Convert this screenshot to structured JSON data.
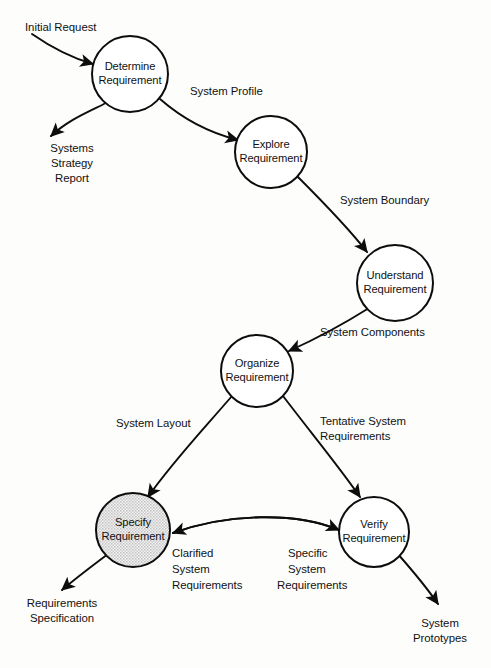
{
  "diagram": {
    "type": "data-flow-diagram",
    "width": 491,
    "height": 668,
    "background_color": "#fdfdfc",
    "line_color": "#0d0d0d",
    "text_color": "#111111",
    "shaded_fill_color": "#dcdcdc"
  },
  "processes": [
    {
      "id": "determine",
      "line1": "Determine",
      "line2": "Requirement",
      "cx": 130,
      "cy": 74,
      "r": 38,
      "shaded": false
    },
    {
      "id": "explore",
      "line1": "Explore",
      "line2": "Requirement",
      "cx": 271,
      "cy": 152,
      "r": 36,
      "shaded": false
    },
    {
      "id": "understand",
      "line1": "Understand",
      "line2": "Requirement",
      "cx": 395,
      "cy": 283,
      "r": 38,
      "shaded": false
    },
    {
      "id": "organize",
      "line1": "Organize",
      "line2": "Requirement",
      "cx": 257,
      "cy": 371,
      "r": 36,
      "shaded": false
    },
    {
      "id": "specify",
      "line1": "Specify",
      "line2": "Requirement",
      "cx": 133,
      "cy": 530,
      "r": 37,
      "shaded": true
    },
    {
      "id": "verify",
      "line1": "Verify",
      "line2": "Requirement",
      "cx": 374,
      "cy": 532,
      "r": 35,
      "shaded": false
    }
  ],
  "flows": [
    {
      "id": "initial-request",
      "label_lines": [
        "Initial Request"
      ],
      "from": "external-input",
      "to": "determine"
    },
    {
      "id": "systems-strategy-report",
      "label_lines": [
        "Systems",
        "Strategy",
        "Report"
      ],
      "from": "determine",
      "to": "external-output"
    },
    {
      "id": "system-profile",
      "label_lines": [
        "System Profile"
      ],
      "from": "determine",
      "to": "explore"
    },
    {
      "id": "system-boundary",
      "label_lines": [
        "System Boundary"
      ],
      "from": "explore",
      "to": "understand"
    },
    {
      "id": "system-components",
      "label_lines": [
        "System Components"
      ],
      "from": "understand",
      "to": "organize"
    },
    {
      "id": "system-layout",
      "label_lines": [
        "System Layout"
      ],
      "from": "organize",
      "to": "specify"
    },
    {
      "id": "tentative-system-requirements",
      "label_lines": [
        "Tentative System",
        "Requirements"
      ],
      "from": "organize",
      "to": "verify"
    },
    {
      "id": "clarified-system-requirements",
      "label_lines": [
        "Clarified",
        "System",
        "Requirements"
      ],
      "from": "verify",
      "to": "specify"
    },
    {
      "id": "specific-system-requirements",
      "label_lines": [
        "Specific",
        "System",
        "Requirements"
      ],
      "from": "specify",
      "to": "verify"
    },
    {
      "id": "requirements-specification",
      "label_lines": [
        "Requirements",
        "Specification"
      ],
      "from": "specify",
      "to": "external-output"
    },
    {
      "id": "system-prototypes",
      "label_lines": [
        "System",
        "Prototypes"
      ],
      "from": "verify",
      "to": "external-output"
    }
  ],
  "labels": {
    "initial_request": "Initial Request",
    "systems": "Systems",
    "strategy": "Strategy",
    "report": "Report",
    "system_profile": "System Profile",
    "system_boundary": "System Boundary",
    "system_components": "System Components",
    "system_layout": "System Layout",
    "tentative_system": "Tentative System",
    "requirements_1": "Requirements",
    "clarified": "Clarified",
    "system_1": "System",
    "requirements_2": "Requirements",
    "specific": "Specific",
    "system_2": "System",
    "requirements_3": "Requirements",
    "requirements_spec_1": "Requirements",
    "requirements_spec_2": "Specification",
    "system_3": "System",
    "prototypes": "Prototypes",
    "p_determine_1": "Determine",
    "p_determine_2": "Requirement",
    "p_explore_1": "Explore",
    "p_explore_2": "Requirement",
    "p_understand_1": "Understand",
    "p_understand_2": "Requirement",
    "p_organize_1": "Organize",
    "p_organize_2": "Requirement",
    "p_specify_1": "Specify",
    "p_specify_2": "Requirement",
    "p_verify_1": "Verify",
    "p_verify_2": "Requirement"
  }
}
